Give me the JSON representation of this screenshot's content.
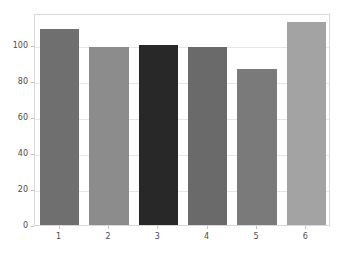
{
  "chart_data": {
    "type": "bar",
    "title": "",
    "subtitle": "",
    "xlabel": "",
    "ylabel": "",
    "categories": [
      "1",
      "2",
      "3",
      "4",
      "5",
      "6"
    ],
    "values": [
      109,
      99,
      100,
      99,
      87,
      113
    ],
    "bar_colors": [
      "#6f6f6f",
      "#8c8c8c",
      "#282828",
      "#6a6a6a",
      "#7a7a7a",
      "#a3a3a3"
    ],
    "ylim": [
      0,
      118
    ],
    "yticks": [
      0,
      20,
      40,
      60,
      80,
      100
    ],
    "ytick_labels": [
      "0",
      "20",
      "40",
      "60",
      "80",
      "100"
    ],
    "xtick_labels": [
      "1",
      "2",
      "3",
      "4",
      "5",
      "6"
    ],
    "grid": true,
    "grid_axis": "y",
    "grid_color": "#e6e6e6",
    "legend": null,
    "legend_position": "none",
    "background_color": "#ffffff",
    "axes_edge_color": "#d8d8d8",
    "tick_color": "#4d4d4d",
    "bar_width_fraction": 0.8
  }
}
